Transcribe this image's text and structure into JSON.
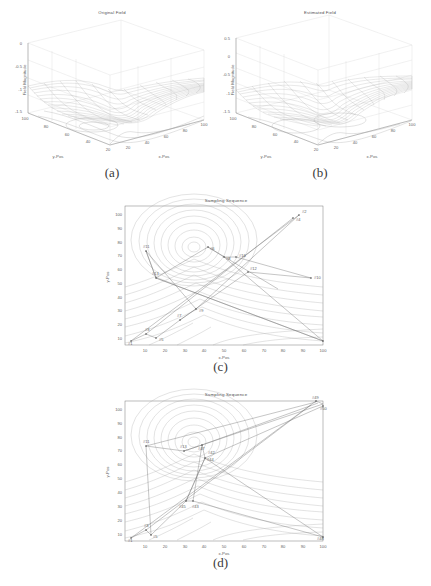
{
  "figure": {
    "page_width": 431,
    "page_height": 586,
    "background": "#ffffff",
    "ink_color": "#5f5f5f",
    "contour_color": "#a5a5a5",
    "path_color": "#6e6e6e"
  },
  "panels": [
    {
      "id": "a",
      "caption": "(a)",
      "title": "Original Field",
      "type": "surface3d",
      "zlabel": "Field Magnitude",
      "xlabel": "x-Pos",
      "ylabel": "y-Pos",
      "zticks": [
        "0",
        "-0.5",
        "-1",
        "-1.5"
      ],
      "zvalues": [
        0,
        -0.5,
        -1,
        -1.5
      ],
      "yticks": [
        "100",
        "80",
        "60",
        "40",
        "20"
      ],
      "yvalues": [
        100,
        80,
        60,
        40,
        20
      ],
      "xticks": [
        "20",
        "40",
        "60",
        "80",
        "100"
      ],
      "xvalues": [
        20,
        40,
        60,
        80,
        100
      ],
      "zlim": [
        -1.5,
        0.25
      ],
      "xlim": [
        0,
        100
      ],
      "ylim": [
        0,
        100
      ]
    },
    {
      "id": "b",
      "caption": "(b)",
      "title": "Estimated Field",
      "type": "surface3d",
      "zlabel": "Field Magnitude",
      "xlabel": "x-Pos",
      "ylabel": "y-Pos",
      "zticks": [
        "0.5",
        "0",
        "-0.5",
        "-1",
        "-1.5"
      ],
      "zvalues": [
        0.5,
        0,
        -0.5,
        -1,
        -1.5
      ],
      "yticks": [
        "100",
        "80",
        "60",
        "40",
        "20"
      ],
      "yvalues": [
        100,
        80,
        60,
        40,
        20
      ],
      "xticks": [
        "20",
        "40",
        "60",
        "80",
        "100"
      ],
      "xvalues": [
        20,
        40,
        60,
        80,
        100
      ],
      "zlim": [
        -1.5,
        0.6
      ],
      "xlim": [
        0,
        100
      ],
      "ylim": [
        0,
        100
      ]
    },
    {
      "id": "c",
      "caption": "(c)",
      "title": "Sampling Sequence",
      "type": "contour_path",
      "xlabel": "x-Pos",
      "ylabel": "y-Pos",
      "xticks": [
        "10",
        "20",
        "30",
        "40",
        "50",
        "60",
        "70",
        "80",
        "90",
        "100"
      ],
      "xvalues": [
        10,
        20,
        30,
        40,
        50,
        60,
        70,
        80,
        90,
        100
      ],
      "yticks": [
        "10",
        "20",
        "30",
        "40",
        "50",
        "60",
        "70",
        "80",
        "90",
        "100"
      ],
      "yvalues": [
        10,
        20,
        30,
        40,
        50,
        60,
        70,
        80,
        90,
        100
      ],
      "xlim": [
        0,
        102
      ],
      "ylim": [
        0,
        102
      ],
      "contour_center": [
        35,
        68
      ],
      "samples": [
        {
          "label": "#1",
          "x": 4,
          "y": 5
        },
        {
          "label": "#3",
          "x": 11,
          "y": 9
        },
        {
          "label": "#5",
          "x": 16,
          "y": 7
        },
        {
          "label": "#7",
          "x": 28,
          "y": 22
        },
        {
          "label": "#9",
          "x": 36,
          "y": 30
        },
        {
          "label": "#11",
          "x": 12,
          "y": 76
        },
        {
          "label": "#13",
          "x": 16,
          "y": 61
        },
        {
          "label": "#2",
          "x": 90,
          "y": 95
        },
        {
          "label": "#4",
          "x": 87,
          "y": 92
        },
        {
          "label": "#6",
          "x": 41,
          "y": 68
        },
        {
          "label": "#8",
          "x": 50,
          "y": 62
        },
        {
          "label": "#16",
          "x": 57,
          "y": 62
        },
        {
          "label": "#10",
          "x": 96,
          "y": 52
        },
        {
          "label": "#12",
          "x": 62,
          "y": 53
        },
        {
          "label": "#14",
          "x": 100,
          "y": 3
        }
      ]
    },
    {
      "id": "d",
      "caption": "(d)",
      "title": "Sampling Sequence",
      "type": "contour_path",
      "xlabel": "x-Pos",
      "ylabel": "y-Pos",
      "xticks": [
        "10",
        "20",
        "30",
        "40",
        "50",
        "60",
        "70",
        "80",
        "90",
        "100"
      ],
      "xvalues": [
        10,
        20,
        30,
        40,
        50,
        60,
        70,
        80,
        90,
        100
      ],
      "yticks": [
        "10",
        "20",
        "30",
        "40",
        "50",
        "60",
        "70",
        "80",
        "90",
        "100"
      ],
      "yvalues": [
        10,
        20,
        30,
        40,
        50,
        60,
        70,
        80,
        90,
        100
      ],
      "xlim": [
        0,
        102
      ],
      "ylim": [
        0,
        102
      ],
      "contour_center": [
        35,
        68
      ],
      "samples": [
        {
          "label": "#1",
          "x": 4,
          "y": 4
        },
        {
          "label": "#3",
          "x": 11,
          "y": 9
        },
        {
          "label": "#5",
          "x": 13,
          "y": 7
        },
        {
          "label": "#45",
          "x": 30,
          "y": 31
        },
        {
          "label": "#43",
          "x": 34,
          "y": 31
        },
        {
          "label": "#11",
          "x": 12,
          "y": 76
        },
        {
          "label": "#13",
          "x": 26,
          "y": 72
        },
        {
          "label": "#47",
          "x": 34,
          "y": 68
        },
        {
          "label": "#42",
          "x": 40,
          "y": 67
        },
        {
          "label": "#44",
          "x": 36,
          "y": 61
        },
        {
          "label": "#49",
          "x": 97,
          "y": 100
        },
        {
          "label": "#50",
          "x": 100,
          "y": 96
        },
        {
          "label": "#48",
          "x": 100,
          "y": 3
        }
      ]
    }
  ]
}
